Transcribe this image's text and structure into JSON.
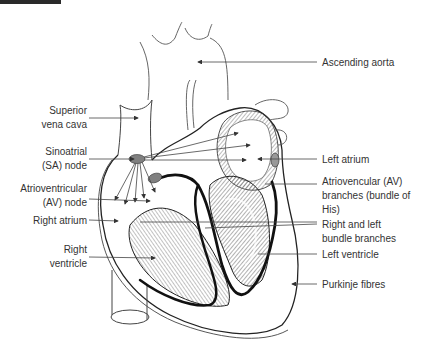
{
  "diagram": {
    "type": "anatomical-heart-conduction-system",
    "left_labels": [
      {
        "id": "superior-vena-cava",
        "lines": [
          "Superior",
          "vena cava"
        ]
      },
      {
        "id": "sinoatrial-node",
        "lines": [
          "Sinoatrial",
          "(SA) node"
        ]
      },
      {
        "id": "atrioventricular-node",
        "lines": [
          "Atrioventricular",
          "(AV) node"
        ]
      },
      {
        "id": "right-atrium",
        "lines": [
          "Right atrium"
        ]
      },
      {
        "id": "right-ventricle",
        "lines": [
          "Right",
          "ventricle"
        ]
      }
    ],
    "right_labels": [
      {
        "id": "ascending-aorta",
        "lines": [
          "Ascending aorta"
        ]
      },
      {
        "id": "left-atrium",
        "lines": [
          "Left atrium"
        ]
      },
      {
        "id": "av-branches",
        "lines": [
          "Atriovencular (AV)",
          "branches (bundle of",
          "His)"
        ]
      },
      {
        "id": "bundle-branches",
        "lines": [
          "Right and left",
          "bundle branches"
        ]
      },
      {
        "id": "left-ventricle",
        "lines": [
          "Left ventricle"
        ]
      },
      {
        "id": "purkinje-fibres",
        "lines": [
          "Purkinje fibres"
        ]
      }
    ],
    "colors": {
      "line": "#333333",
      "node_fill": "#808080",
      "conduction_path": "#111111",
      "muscle_shading": "#9a9a9a"
    }
  }
}
